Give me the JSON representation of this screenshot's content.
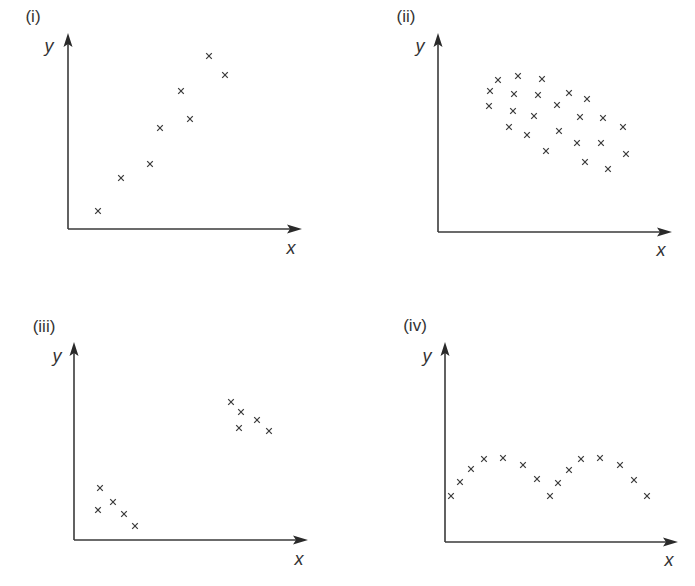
{
  "figure": {
    "colors": {
      "stroke": "#3a3a3a",
      "text": "#333333",
      "background": "#ffffff"
    },
    "marker_symbol": "×"
  },
  "chart_data": [
    {
      "type": "scatter",
      "title": "(i)",
      "xlabel": "x",
      "ylabel": "y",
      "grid": false,
      "ticks": false,
      "description": "strong positive linear correlation",
      "layout": {
        "origin": [
          68,
          229
        ],
        "x_tip": [
          302,
          229
        ],
        "y_tip": [
          68,
          33
        ],
        "title_pos": [
          33,
          22
        ],
        "xlabel_pos": [
          291,
          254
        ],
        "ylabel_pos": [
          49,
          52
        ]
      },
      "points": [
        [
          98,
          211
        ],
        [
          121,
          178
        ],
        [
          150,
          164
        ],
        [
          160,
          128
        ],
        [
          181,
          91
        ],
        [
          190,
          119
        ],
        [
          209,
          56
        ],
        [
          225,
          75
        ]
      ]
    },
    {
      "type": "scatter",
      "title": "(ii)",
      "xlabel": "x",
      "ylabel": "y",
      "grid": false,
      "ticks": false,
      "description": "weak negative correlation, dispersed cloud",
      "layout": {
        "origin": [
          438,
          232
        ],
        "x_tip": [
          672,
          232
        ],
        "y_tip": [
          438,
          33
        ],
        "title_pos": [
          406,
          22
        ],
        "xlabel_pos": [
          661,
          256
        ],
        "ylabel_pos": [
          420,
          52
        ]
      },
      "points": [
        [
          498,
          80
        ],
        [
          518,
          76
        ],
        [
          542,
          79
        ],
        [
          490,
          91
        ],
        [
          514,
          94
        ],
        [
          538,
          95
        ],
        [
          569,
          93
        ],
        [
          587,
          99
        ],
        [
          489,
          106
        ],
        [
          513,
          111
        ],
        [
          557,
          105
        ],
        [
          534,
          116
        ],
        [
          580,
          117
        ],
        [
          603,
          118
        ],
        [
          509,
          127
        ],
        [
          527,
          135
        ],
        [
          559,
          131
        ],
        [
          623,
          127
        ],
        [
          577,
          143
        ],
        [
          601,
          143
        ],
        [
          546,
          151
        ],
        [
          626,
          154
        ],
        [
          585,
          162
        ],
        [
          608,
          169
        ]
      ]
    },
    {
      "type": "scatter",
      "title": "(iii)",
      "xlabel": "x",
      "ylabel": "y",
      "grid": false,
      "ticks": false,
      "description": "two separate clusters, each with negative trend",
      "layout": {
        "origin": [
          74,
          540
        ],
        "x_tip": [
          308,
          540
        ],
        "y_tip": [
          74,
          342
        ],
        "title_pos": [
          44,
          332
        ],
        "xlabel_pos": [
          299,
          565
        ],
        "ylabel_pos": [
          57,
          362
        ]
      },
      "points": [
        [
          100,
          488
        ],
        [
          98,
          510
        ],
        [
          113,
          502
        ],
        [
          124,
          514
        ],
        [
          135,
          526
        ],
        [
          231,
          402
        ],
        [
          241,
          412
        ],
        [
          239,
          428
        ],
        [
          257,
          420
        ],
        [
          269,
          431
        ]
      ]
    },
    {
      "type": "scatter",
      "title": "(iv)",
      "xlabel": "x",
      "ylabel": "y",
      "grid": false,
      "ticks": false,
      "description": "non-linear periodic (wave) relationship",
      "layout": {
        "origin": [
          445,
          542
        ],
        "x_tip": [
          678,
          542
        ],
        "y_tip": [
          445,
          342
        ],
        "title_pos": [
          415,
          331
        ],
        "xlabel_pos": [
          669,
          566
        ],
        "ylabel_pos": [
          427,
          362
        ]
      },
      "points": [
        [
          451,
          496
        ],
        [
          460,
          482
        ],
        [
          471,
          469
        ],
        [
          484,
          459
        ],
        [
          503,
          458
        ],
        [
          523,
          465
        ],
        [
          537,
          479
        ],
        [
          550,
          496
        ],
        [
          558,
          483
        ],
        [
          569,
          470
        ],
        [
          581,
          459
        ],
        [
          600,
          458
        ],
        [
          620,
          465
        ],
        [
          634,
          480
        ],
        [
          647,
          496
        ]
      ]
    }
  ]
}
